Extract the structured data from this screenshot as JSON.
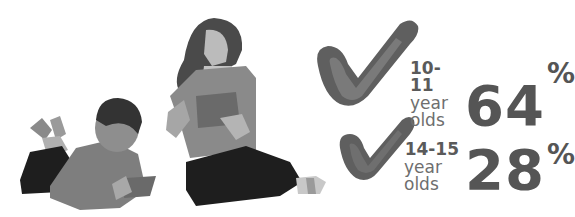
{
  "illustration": {
    "description": "Boy lying on floor with tablet and girl sitting reading a tablet",
    "colors": {
      "hair": "#4a4a4a",
      "skin": "#b8b8b8",
      "shirt": "#8a8a8a",
      "pants": "#1e1e1e",
      "tablet": "#707070"
    }
  },
  "stats": [
    {
      "age_range": "10-11",
      "label": "year olds",
      "value": "64",
      "unit": "%"
    },
    {
      "age_range": "14-15",
      "label": "year olds",
      "value": "28",
      "unit": "%"
    }
  ],
  "colors": {
    "check_dark": "#5f5f5f",
    "check_mid": "#7a7a7a",
    "text": "#555555"
  }
}
